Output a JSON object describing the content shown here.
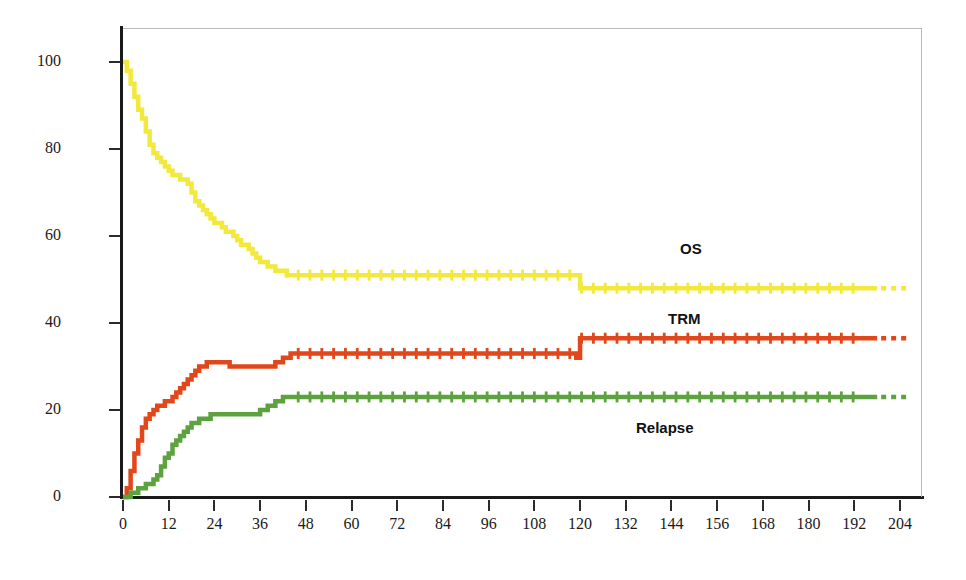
{
  "chart_data": {
    "type": "line",
    "title": "",
    "subtitle": "",
    "xlabel": "",
    "ylabel": "Probability %",
    "xlim": [
      0,
      204
    ],
    "ylim": [
      0,
      100
    ],
    "grid": false,
    "legend_position": "inline-annotations",
    "x_ticks": [
      0,
      12,
      24,
      36,
      48,
      60,
      72,
      84,
      96,
      108,
      120,
      132,
      144,
      156,
      168,
      180,
      192,
      204
    ],
    "y_ticks": [
      0,
      20,
      40,
      60,
      80,
      100
    ],
    "annotations": [
      {
        "text": "OS",
        "series": "OS",
        "x": 140,
        "y": 57
      },
      {
        "text": "TRM",
        "series": "TRM",
        "x": 137,
        "y": 42
      },
      {
        "text": "Relapse",
        "series": "Relapse",
        "x": 128,
        "y": 18
      }
    ],
    "series": [
      {
        "name": "OS",
        "color": "#F2E93C",
        "label": "OS",
        "censor_marks": true,
        "final_value": 48,
        "points": [
          [
            0,
            100
          ],
          [
            1,
            98
          ],
          [
            2,
            95
          ],
          [
            3,
            92
          ],
          [
            4,
            89
          ],
          [
            5,
            87
          ],
          [
            6,
            84
          ],
          [
            7,
            81
          ],
          [
            8,
            79
          ],
          [
            9,
            78
          ],
          [
            10,
            77
          ],
          [
            11,
            76
          ],
          [
            12,
            75
          ],
          [
            13,
            74
          ],
          [
            14,
            74
          ],
          [
            15,
            73
          ],
          [
            16,
            73
          ],
          [
            17,
            72
          ],
          [
            18,
            70
          ],
          [
            19,
            68
          ],
          [
            20,
            67
          ],
          [
            21,
            66
          ],
          [
            22,
            65
          ],
          [
            23,
            64
          ],
          [
            24,
            63
          ],
          [
            25,
            63
          ],
          [
            26,
            62
          ],
          [
            27,
            61
          ],
          [
            28,
            61
          ],
          [
            29,
            60
          ],
          [
            30,
            59
          ],
          [
            31,
            58
          ],
          [
            32,
            58
          ],
          [
            33,
            57
          ],
          [
            34,
            56
          ],
          [
            35,
            55
          ],
          [
            36,
            54
          ],
          [
            37,
            54
          ],
          [
            38,
            53
          ],
          [
            39,
            53
          ],
          [
            40,
            52
          ],
          [
            41,
            52
          ],
          [
            42,
            52
          ],
          [
            43,
            51
          ],
          [
            44,
            51
          ],
          [
            45,
            51
          ],
          [
            46,
            51
          ],
          [
            48,
            51
          ],
          [
            60,
            51
          ],
          [
            72,
            51
          ],
          [
            84,
            51
          ],
          [
            96,
            51
          ],
          [
            108,
            51
          ],
          [
            119,
            51
          ],
          [
            120,
            48
          ],
          [
            132,
            48
          ],
          [
            144,
            48
          ],
          [
            156,
            48
          ],
          [
            168,
            48
          ],
          [
            180,
            48
          ],
          [
            190,
            48
          ],
          [
            198,
            48
          ]
        ]
      },
      {
        "name": "TRM",
        "color": "#E2471B",
        "label": "TRM",
        "censor_marks": true,
        "final_value": 36.5,
        "points": [
          [
            0,
            0
          ],
          [
            1,
            2
          ],
          [
            2,
            6
          ],
          [
            3,
            10
          ],
          [
            4,
            13
          ],
          [
            5,
            16
          ],
          [
            6,
            18
          ],
          [
            7,
            19
          ],
          [
            8,
            20
          ],
          [
            9,
            21
          ],
          [
            10,
            21
          ],
          [
            11,
            22
          ],
          [
            12,
            22
          ],
          [
            13,
            23
          ],
          [
            14,
            24
          ],
          [
            15,
            25
          ],
          [
            16,
            26
          ],
          [
            17,
            27
          ],
          [
            18,
            28
          ],
          [
            19,
            29
          ],
          [
            20,
            30
          ],
          [
            21,
            30
          ],
          [
            22,
            31
          ],
          [
            23,
            31
          ],
          [
            24,
            31
          ],
          [
            26,
            31
          ],
          [
            28,
            30
          ],
          [
            30,
            30
          ],
          [
            32,
            30
          ],
          [
            34,
            30
          ],
          [
            36,
            30
          ],
          [
            38,
            30
          ],
          [
            40,
            31
          ],
          [
            42,
            32
          ],
          [
            44,
            33
          ],
          [
            46,
            33
          ],
          [
            48,
            33
          ],
          [
            60,
            33
          ],
          [
            72,
            33
          ],
          [
            84,
            33
          ],
          [
            96,
            33
          ],
          [
            108,
            33
          ],
          [
            118,
            33
          ],
          [
            119,
            32
          ],
          [
            120,
            36.5
          ],
          [
            132,
            36.5
          ],
          [
            144,
            36.5
          ],
          [
            156,
            36.5
          ],
          [
            168,
            36.5
          ],
          [
            180,
            36.5
          ],
          [
            190,
            36.5
          ],
          [
            198,
            36.5
          ]
        ]
      },
      {
        "name": "Relapse",
        "color": "#5CA33F",
        "label": "Relapse",
        "censor_marks": true,
        "final_value": 23,
        "points": [
          [
            0,
            0
          ],
          [
            2,
            1
          ],
          [
            4,
            2
          ],
          [
            6,
            3
          ],
          [
            8,
            4
          ],
          [
            9,
            5
          ],
          [
            10,
            7
          ],
          [
            11,
            9
          ],
          [
            12,
            10
          ],
          [
            13,
            12
          ],
          [
            14,
            13
          ],
          [
            15,
            14
          ],
          [
            16,
            15
          ],
          [
            17,
            16
          ],
          [
            18,
            17
          ],
          [
            19,
            17
          ],
          [
            20,
            18
          ],
          [
            21,
            18
          ],
          [
            22,
            18
          ],
          [
            23,
            19
          ],
          [
            24,
            19
          ],
          [
            26,
            19
          ],
          [
            28,
            19
          ],
          [
            30,
            19
          ],
          [
            32,
            19
          ],
          [
            34,
            19
          ],
          [
            36,
            20
          ],
          [
            38,
            21
          ],
          [
            40,
            22
          ],
          [
            42,
            23
          ],
          [
            44,
            23
          ],
          [
            46,
            23
          ],
          [
            48,
            23
          ],
          [
            60,
            23
          ],
          [
            72,
            23
          ],
          [
            84,
            23
          ],
          [
            96,
            23
          ],
          [
            108,
            23
          ],
          [
            120,
            23
          ],
          [
            132,
            23
          ],
          [
            144,
            23
          ],
          [
            156,
            23
          ],
          [
            168,
            23
          ],
          [
            180,
            23
          ],
          [
            190,
            23
          ],
          [
            198,
            23
          ]
        ]
      }
    ]
  },
  "axes": {
    "y_title": "Probability %",
    "y_title_color": "#1f7a32",
    "x_tick_labels": [
      "0",
      "12",
      "24",
      "36",
      "48",
      "60",
      "72",
      "84",
      "96",
      "108",
      "120",
      "132",
      "144",
      "156",
      "168",
      "180",
      "192",
      "204"
    ],
    "y_tick_labels": [
      "0",
      "20",
      "40",
      "60",
      "80",
      "100"
    ]
  },
  "annotations": {
    "os": "OS",
    "trm": "TRM",
    "relapse": "Relapse"
  }
}
